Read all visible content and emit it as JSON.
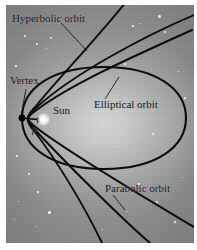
{
  "figure": {
    "kind": "astronomy-orbit-diagram",
    "background_color": "#b0b0b0",
    "curve_color": "#0c0c10",
    "frame_color": "#ffffff"
  },
  "labels": {
    "hyperbolic": "Hyperbolic orbit",
    "vertex": "Vertex",
    "sun": "Sun",
    "p": "p",
    "elliptical": "Elliptical orbit",
    "parabolic": "Parabolic orbit"
  },
  "markers": {
    "vertex_point": {
      "x": 22,
      "y": 118
    },
    "sun_point": {
      "x": 44,
      "y": 120
    }
  },
  "curves": [
    {
      "name": "elliptical-orbit",
      "type": "ellipse"
    },
    {
      "name": "parabolic-orbit",
      "type": "parabola"
    },
    {
      "name": "hyperbolic-orbit-outer",
      "type": "hyperbola"
    },
    {
      "name": "hyperbolic-orbit-inner",
      "type": "hyperbola"
    }
  ]
}
